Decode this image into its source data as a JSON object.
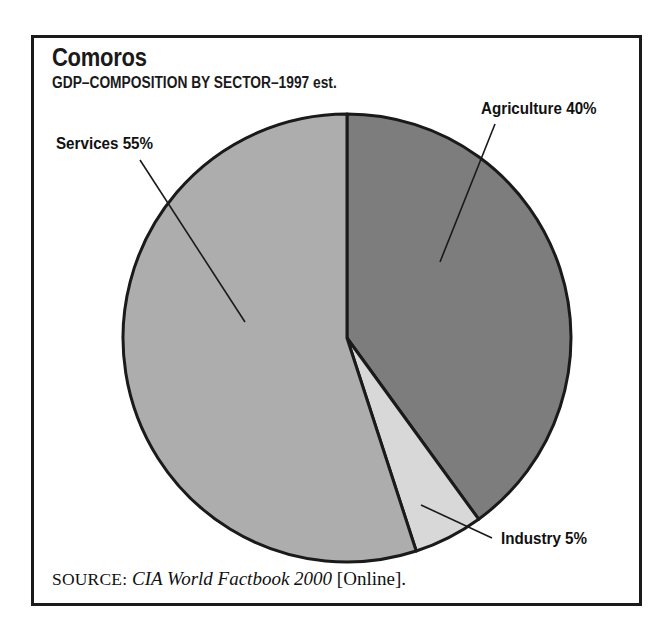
{
  "figure": {
    "title": "Comoros",
    "subtitle": "GDP–COMPOSITION BY SECTOR–1997 est.",
    "source": {
      "label": "SOURCE:",
      "work": "CIA World Factbook 2000",
      "medium": "[Online]."
    },
    "frame_color": "#1a1a1a",
    "background": "#ffffff"
  },
  "labels": {
    "agriculture": "Agriculture 40%",
    "services": "Services 55%",
    "industry": "Industry 5%"
  },
  "chart_data": {
    "type": "pie",
    "title": "Comoros",
    "subtitle": "GDP–COMPOSITION BY SECTOR–1997 est.",
    "categories": [
      "Agriculture",
      "Industry",
      "Services"
    ],
    "values": [
      40,
      5,
      55
    ],
    "unit": "percent",
    "data_labels": [
      "Agriculture 40%",
      "Industry 5%",
      "Services 55%"
    ],
    "colors": [
      "#7d7d7d",
      "#d8d8d8",
      "#adadad"
    ],
    "slice_edge_color": "#1a1a1a",
    "start_angle_deg": 0,
    "direction": "clockwise",
    "legend": "none",
    "label_placement": "outside-with-leader-lines",
    "center_px": [
      347,
      338
    ],
    "radius_px": 224,
    "xlabel": "",
    "ylabel": ""
  }
}
